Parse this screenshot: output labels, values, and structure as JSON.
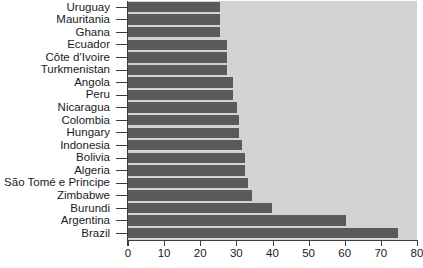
{
  "chart_data": {
    "type": "bar",
    "orientation": "horizontal",
    "title": "",
    "subtitle": "",
    "xlabel": "",
    "ylabel": "",
    "xlim": [
      0,
      80
    ],
    "xticks": [
      0,
      10,
      20,
      30,
      40,
      50,
      60,
      70,
      80
    ],
    "xtick_labels": [
      "0",
      "10",
      "20",
      "30",
      "40",
      "50",
      "60",
      "70",
      "80"
    ],
    "grid": false,
    "legend": null,
    "legend_position": "none",
    "bar_color": "#5a5a5a",
    "panel_background": "#d3d3d3",
    "figure_background": "#ffffff",
    "axis_color": "#3d3d3d",
    "text_color": "#1a1a1a",
    "categories": [
      "Uruguay",
      "Mauritania",
      "Ghana",
      "Ecuador",
      "Côte d’Ivoire",
      "Turkmenistan",
      "Angola",
      "Peru",
      "Nicaragua",
      "Colombia",
      "Hungary",
      "Indonesia",
      "Bolivia",
      "Algeria",
      "São Tomé e Principe",
      "Zimbabwe",
      "Burundi",
      "Argentina",
      "Brazil"
    ],
    "values": [
      25.5,
      25.5,
      25.6,
      27.3,
      27.4,
      27.4,
      29.0,
      29.1,
      30.3,
      30.6,
      30.6,
      31.6,
      32.5,
      32.5,
      33.3,
      34.4,
      39.8,
      60.4,
      74.8
    ]
  }
}
